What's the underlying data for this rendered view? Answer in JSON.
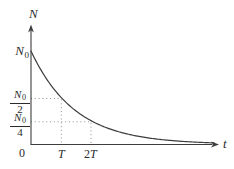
{
  "colors": {
    "axis": "#3d3d3d",
    "curve": "#3d3d3d",
    "dotted": "#8f8f8f",
    "text": "#2b2b2b",
    "background": "#ffffff"
  },
  "labels": {
    "y_axis_title": "N",
    "x_axis_title": "t",
    "origin": "0",
    "initial": {
      "main": "N",
      "sub": "0"
    },
    "half": {
      "num_main": "N",
      "num_sub": "0",
      "den": "2"
    },
    "quarter": {
      "num_main": "N",
      "num_sub": "0",
      "den": "4"
    },
    "tick_T": "T",
    "tick_2T_digit": "2",
    "tick_2T_letter": "T"
  },
  "chart_data": {
    "type": "line",
    "title": "",
    "xlabel": "t",
    "ylabel": "N",
    "x_ticks": [
      "0",
      "T",
      "2T"
    ],
    "y_ticks": [
      "N₀",
      "N₀/2",
      "N₀/4"
    ],
    "relation": "N(t) = N₀ · 2^(−t/T)",
    "series": [
      {
        "name": "N(t)",
        "x_in_T_units": [
          0,
          1,
          2,
          3,
          4,
          5,
          6
        ],
        "y_in_N0_units": [
          1,
          0.5,
          0.25,
          0.125,
          0.0625,
          0.03125,
          0.015625
        ]
      }
    ],
    "key_points": [
      {
        "t": "0",
        "N": "N₀"
      },
      {
        "t": "T",
        "N": "N₀/2"
      },
      {
        "t": "2T",
        "N": "N₀/4"
      }
    ],
    "guide_lines": [
      {
        "level": "N₀/2",
        "meets_curve_at": "(T, N₀/2)",
        "style": "dotted"
      },
      {
        "level": "N₀/4",
        "meets_curve_at": "(2T, N₀/4)",
        "style": "dotted"
      }
    ],
    "xlim": [
      "0",
      "~6T"
    ],
    "ylim": [
      "0",
      "N₀"
    ],
    "grid": false,
    "legend": false
  }
}
